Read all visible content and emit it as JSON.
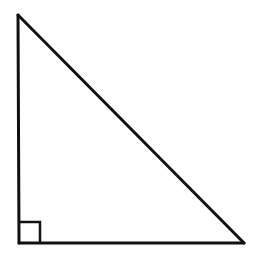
{
  "diagram": {
    "type": "right-triangle",
    "stroke_color": "#111111",
    "background": "#ffffff",
    "vertices": {
      "top": [
        18,
        15
      ],
      "bottom_left": [
        19,
        243
      ],
      "bottom_right": [
        244,
        243
      ]
    },
    "right_angle_marker": {
      "corner": "bottom_left",
      "size": 21
    },
    "labels": []
  }
}
